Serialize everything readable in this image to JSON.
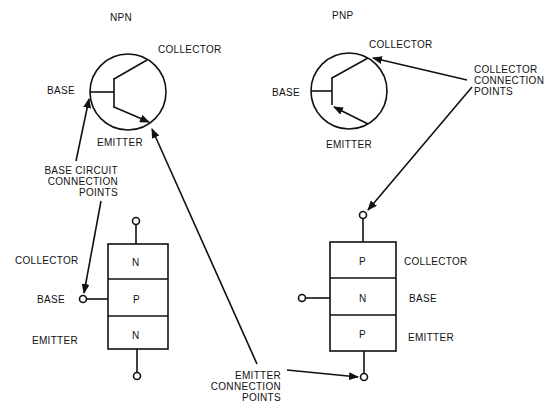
{
  "npn": {
    "title": "NPN",
    "symbol": {
      "collector": "COLLECTOR",
      "base": "BASE",
      "emitter": "EMITTER"
    },
    "layers": {
      "top": "N",
      "middle": "P",
      "bottom": "N"
    },
    "block_labels": {
      "collector": "COLLECTOR",
      "base": "BASE",
      "emitter": "EMITTER"
    }
  },
  "pnp": {
    "title": "PNP",
    "symbol": {
      "collector": "COLLECTOR",
      "base": "BASE",
      "emitter": "EMITTER"
    },
    "layers": {
      "top": "P",
      "middle": "N",
      "bottom": "P"
    },
    "block_labels": {
      "collector": "COLLECTOR",
      "base": "BASE",
      "emitter": "EMITTER"
    }
  },
  "callouts": {
    "base": [
      "BASE CIRCUIT",
      "CONNECTION",
      "POINTS"
    ],
    "collector": [
      "COLLECTOR",
      "CONNECTION",
      "POINTS"
    ],
    "emitter": [
      "EMITTER",
      "CONNECTION",
      "POINTS"
    ]
  }
}
